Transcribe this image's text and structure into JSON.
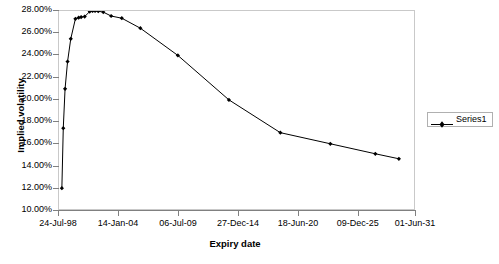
{
  "chart_data": {
    "type": "line",
    "title": "",
    "xlabel": "Expiry date",
    "ylabel": "Implied volatility",
    "legend": [
      "Series1"
    ],
    "legend_position": "right",
    "grid": false,
    "marker": "diamond",
    "line_color": "#000000",
    "marker_color": "#000000",
    "plot_border_color": "#c9c9c9",
    "axis_color": "#808080",
    "xlim": [
      "24-Jul-98",
      "01-Jun-31"
    ],
    "ylim": [
      10.0,
      28.0
    ],
    "ytick_labels": [
      "28.00%",
      "26.00%",
      "24.00%",
      "22.00%",
      "20.00%",
      "18.00%",
      "16.00%",
      "14.00%",
      "12.00%",
      "10.00%"
    ],
    "ytick_values": [
      28,
      26,
      24,
      22,
      20,
      18,
      16,
      14,
      12,
      10
    ],
    "xtick_labels": [
      "24-Jul-98",
      "14-Jan-04",
      "06-Jul-09",
      "27-Dec-14",
      "18-Jun-20",
      "09-Dec-25",
      "01-Jun-31"
    ],
    "xtick_fractions": [
      0.0,
      0.168,
      0.336,
      0.504,
      0.672,
      0.84,
      1.0
    ],
    "series": [
      {
        "name": "Series1",
        "points": [
          {
            "x": 0.008,
            "y": 12.05
          },
          {
            "x": 0.012,
            "y": 17.45
          },
          {
            "x": 0.017,
            "y": 21.0
          },
          {
            "x": 0.024,
            "y": 23.45
          },
          {
            "x": 0.033,
            "y": 25.5
          },
          {
            "x": 0.046,
            "y": 27.3
          },
          {
            "x": 0.055,
            "y": 27.4
          },
          {
            "x": 0.062,
            "y": 27.45
          },
          {
            "x": 0.072,
            "y": 27.5
          },
          {
            "x": 0.086,
            "y": 27.95
          },
          {
            "x": 0.094,
            "y": 28.0
          },
          {
            "x": 0.101,
            "y": 28.0
          },
          {
            "x": 0.11,
            "y": 27.98
          },
          {
            "x": 0.124,
            "y": 27.9
          },
          {
            "x": 0.146,
            "y": 27.55
          },
          {
            "x": 0.176,
            "y": 27.35
          },
          {
            "x": 0.228,
            "y": 26.45
          },
          {
            "x": 0.333,
            "y": 24.0
          },
          {
            "x": 0.476,
            "y": 20.0
          },
          {
            "x": 0.62,
            "y": 17.05
          },
          {
            "x": 0.76,
            "y": 16.05
          },
          {
            "x": 0.886,
            "y": 15.15
          },
          {
            "x": 0.952,
            "y": 14.7
          }
        ]
      }
    ]
  },
  "legend_box": {
    "label": "Series1"
  },
  "axes": {
    "y_title": "Implied volatility",
    "x_title": "Expiry date"
  }
}
